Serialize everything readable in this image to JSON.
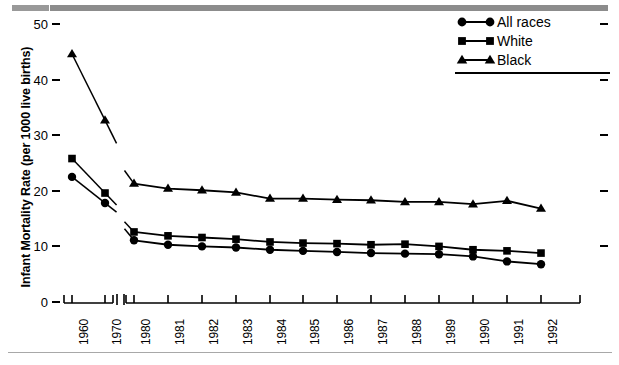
{
  "chart_data": {
    "type": "line",
    "title": "",
    "xlabel": "",
    "ylabel": "Infant Mortality Rate (per 1000 live births)",
    "categories": [
      "1960",
      "1970",
      "1980",
      "1981",
      "1982",
      "1983",
      "1984",
      "1985",
      "1986",
      "1987",
      "1988",
      "1989",
      "1990",
      "1991",
      "1992"
    ],
    "axis_break_after_category": "1970",
    "ylim": [
      0,
      52
    ],
    "yticks": [
      0,
      10,
      20,
      30,
      40,
      50
    ],
    "ytick_labels": [
      "0",
      "10",
      "20",
      "30",
      "40",
      "50"
    ],
    "grid": false,
    "legend_position": "top-right",
    "series": [
      {
        "name": "All races",
        "marker": "circle",
        "color": "#000000",
        "values": [
          22.5,
          17.8,
          11.1,
          10.3,
          10.0,
          9.8,
          9.4,
          9.2,
          9.0,
          8.8,
          8.7,
          8.6,
          8.2,
          7.3,
          6.8
        ]
      },
      {
        "name": "White",
        "marker": "square",
        "color": "#000000",
        "values": [
          25.8,
          19.6,
          12.6,
          11.9,
          11.6,
          11.3,
          10.8,
          10.6,
          10.5,
          10.3,
          10.4,
          10.0,
          9.4,
          9.2,
          8.8
        ]
      },
      {
        "name": "Black",
        "marker": "triangle",
        "color": "#000000",
        "values": [
          44.6,
          32.7,
          21.3,
          20.4,
          20.1,
          19.7,
          18.6,
          18.6,
          18.4,
          18.3,
          18.0,
          18.0,
          17.6,
          18.2,
          16.8
        ]
      }
    ]
  },
  "legend": {
    "items": [
      {
        "label": "All races",
        "marker": "circle-marker"
      },
      {
        "label": "White",
        "marker": "square-marker"
      },
      {
        "label": "Black",
        "marker": "triangle-marker"
      }
    ]
  },
  "axes": {
    "y_title": "Infant Mortality Rate (per 1000 live births)"
  }
}
